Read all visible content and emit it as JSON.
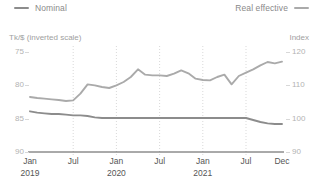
{
  "legend": {
    "left": {
      "label": "Nominal",
      "color": "#8c8c8c",
      "icon": "line-swatch"
    },
    "right": {
      "label": "Real effective",
      "color": "#aaaaaa",
      "icon": "line-swatch"
    }
  },
  "axes": {
    "left_title": "Tk/$ (inverted scale)",
    "right_title": "Index",
    "left_ticks": [
      "75",
      "80",
      "85",
      "90"
    ],
    "right_ticks": [
      "120",
      "110",
      "100",
      "90"
    ],
    "x_ticks": [
      {
        "month": "Jan",
        "year": "2019"
      },
      {
        "month": "Jul",
        "year": ""
      },
      {
        "month": "Jan",
        "year": "2020"
      },
      {
        "month": "Jul",
        "year": ""
      },
      {
        "month": "Jan",
        "year": "2021"
      },
      {
        "month": "Jul",
        "year": ""
      },
      {
        "month": "Dec",
        "year": ""
      }
    ]
  },
  "chart_data": {
    "type": "line",
    "title": "",
    "subtitle": "",
    "xlabel": "",
    "ylabel": "Tk/$ (inverted scale)",
    "ylabel_right": "Index",
    "ylim": [
      90,
      75
    ],
    "ylim_right": [
      90,
      120
    ],
    "y_inverted": true,
    "grid": "vertical-dotted",
    "legend_position": "top",
    "x": [
      "2019-01",
      "2019-02",
      "2019-03",
      "2019-04",
      "2019-05",
      "2019-06",
      "2019-07",
      "2019-08",
      "2019-09",
      "2019-10",
      "2019-11",
      "2019-12",
      "2020-01",
      "2020-02",
      "2020-03",
      "2020-04",
      "2020-05",
      "2020-06",
      "2020-07",
      "2020-08",
      "2020-09",
      "2020-10",
      "2020-11",
      "2020-12",
      "2021-01",
      "2021-02",
      "2021-03",
      "2021-04",
      "2021-05",
      "2021-06",
      "2021-07",
      "2021-08",
      "2021-09",
      "2021-10",
      "2021-11",
      "2021-12"
    ],
    "series": [
      {
        "name": "Nominal",
        "axis": "left",
        "unit": "Tk/$ (inverted scale)",
        "color": "#8c8c8c",
        "values": [
          83.9,
          84.1,
          84.2,
          84.3,
          84.3,
          84.4,
          84.5,
          84.5,
          84.6,
          84.8,
          84.9,
          84.9,
          84.9,
          84.9,
          84.9,
          84.9,
          84.9,
          84.9,
          84.9,
          84.9,
          84.9,
          84.9,
          84.9,
          84.9,
          84.9,
          84.9,
          84.9,
          84.9,
          84.9,
          84.9,
          84.9,
          85.2,
          85.5,
          85.7,
          85.8,
          85.8
        ]
      },
      {
        "name": "Real effective",
        "axis": "right",
        "unit": "Index",
        "color": "#aaaaaa",
        "values": [
          106.5,
          106.2,
          106.0,
          105.8,
          105.6,
          105.3,
          105.5,
          107.5,
          110.3,
          110.0,
          109.5,
          109.2,
          110.0,
          111.0,
          112.5,
          114.8,
          113.2,
          113.0,
          113.0,
          112.8,
          113.5,
          114.5,
          113.6,
          112.0,
          111.6,
          111.5,
          112.5,
          113.2,
          110.3,
          112.8,
          113.8,
          114.8,
          116.0,
          117.0,
          116.6,
          117.1
        ]
      }
    ],
    "vertical_gridlines": [
      "2019-07",
      "2020-01",
      "2020-07",
      "2021-01",
      "2021-07"
    ]
  }
}
